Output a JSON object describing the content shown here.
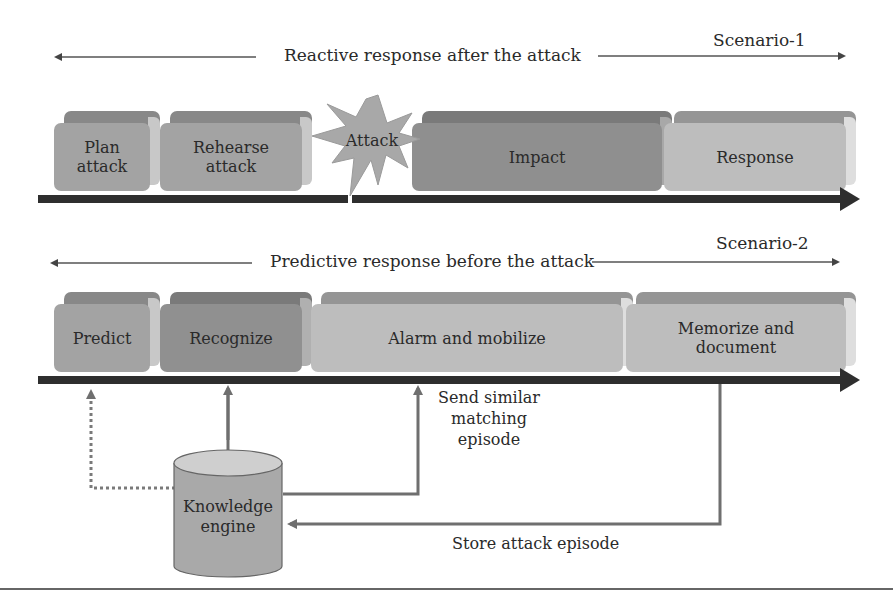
{
  "scenario1": {
    "tag": "Scenario-1",
    "caption": "Reactive response after the attack",
    "steps": [
      {
        "label": "Plan\nattack",
        "shade": "medium"
      },
      {
        "label": "Rehearse\nattack",
        "shade": "medium"
      },
      {
        "label": "Attack",
        "shade": "star"
      },
      {
        "label": "Impact",
        "shade": "dark"
      },
      {
        "label": "Response",
        "shade": "light"
      }
    ]
  },
  "scenario2": {
    "tag": "Scenario-2",
    "caption": "Predictive response before the attack",
    "steps": [
      {
        "label": "Predict",
        "shade": "medium"
      },
      {
        "label": "Recognize",
        "shade": "dark"
      },
      {
        "label": "Alarm and mobilize",
        "shade": "light"
      },
      {
        "label": "Memorize and\ndocument",
        "shade": "light"
      }
    ]
  },
  "knowledge_engine": {
    "label": "Knowledge\nengine"
  },
  "flows": {
    "send_similar": "Send similar\nmatching\nepisode",
    "store_attack": "Store attack episode"
  },
  "colors": {
    "dark_face": "#8f8f8f",
    "dark_top": "#7a7a7a",
    "medium_face": "#a3a3a3",
    "medium_top": "#888888",
    "light_face": "#bdbdbd",
    "light_top": "#959595",
    "side": "#d4d4d4",
    "bar": "#2e2e2e",
    "connector": "#6f6f6f"
  }
}
